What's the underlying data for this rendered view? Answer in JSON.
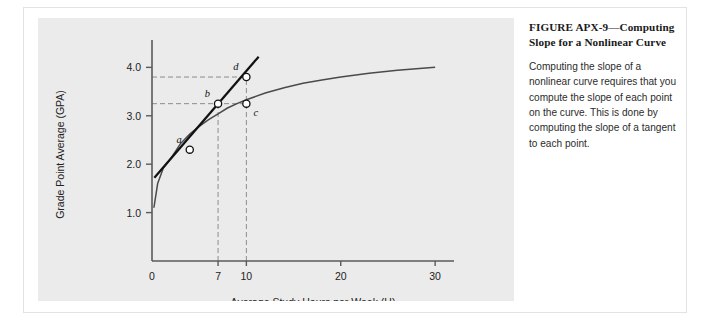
{
  "figure": {
    "caption_title": "FIGURE APX-9—Computing Slope for a Nonlinear Curve",
    "caption_body": "Computing the slope of a nonlinear curve requires that you compute the slope of each point on the curve. This is done by computing the slope of a tangent to each point."
  },
  "colors": {
    "panel_background": "#ebebeb",
    "frame_background": "#ffffff",
    "axis": "#5a5a5a",
    "curve": "#4a4a4a",
    "tangent": "#111111",
    "dashed_guide": "#8c8c8c",
    "point_fill": "#ffffff",
    "point_stroke": "#111111",
    "text": "#222222"
  },
  "chart_data": {
    "type": "line",
    "title": "",
    "xlabel": "Average Study Hours per Week (H)",
    "ylabel": "Grade Point Average (GPA)",
    "xlim": [
      0,
      32
    ],
    "ylim": [
      0,
      4.4
    ],
    "xticks": [
      0,
      7,
      10,
      20,
      30
    ],
    "xtick_labels": [
      "0",
      "7",
      "10",
      "20",
      "30"
    ],
    "yticks": [
      1.0,
      2.0,
      3.0,
      4.0
    ],
    "ytick_labels": [
      "1.0",
      "2.0",
      "3.0",
      "4.0"
    ],
    "grid": false,
    "legend": "none",
    "series": [
      {
        "name": "nonlinear-curve",
        "style": "solid-thin",
        "x": [
          0.2,
          0.6,
          1.2,
          2,
          3,
          4,
          5,
          6,
          7,
          8,
          9,
          10,
          12,
          14,
          16,
          18,
          20,
          23,
          26,
          30
        ],
        "y": [
          1.1,
          1.6,
          1.92,
          2.12,
          2.42,
          2.62,
          2.78,
          2.92,
          3.04,
          3.16,
          3.25,
          3.33,
          3.47,
          3.58,
          3.67,
          3.74,
          3.8,
          3.88,
          3.94,
          4.0
        ]
      },
      {
        "name": "tangent-line-at-a",
        "style": "solid-thick",
        "x": [
          0.25,
          11.3
        ],
        "y": [
          1.72,
          4.22
        ]
      }
    ],
    "points": [
      {
        "label": "a",
        "x": 4,
        "y": 2.3,
        "on": "curve-and-tangent",
        "label_position": "above-left"
      },
      {
        "label": "b",
        "x": 7,
        "y": 3.25,
        "on": "tangent",
        "label_position": "above-left"
      },
      {
        "label": "c",
        "x": 10,
        "y": 3.25,
        "on": "curve",
        "label_position": "below-right"
      },
      {
        "label": "d",
        "x": 10,
        "y": 3.8,
        "on": "tangent",
        "label_position": "above-left"
      }
    ],
    "guides": [
      {
        "type": "horizontal-dashed",
        "y": 3.8,
        "from_x": 0,
        "to_x": 10
      },
      {
        "type": "horizontal-dashed",
        "y": 3.25,
        "from_x": 0,
        "to_x": 10
      },
      {
        "type": "vertical-dashed",
        "x": 7,
        "from_y": 0,
        "to_y": 3.25
      },
      {
        "type": "vertical-dashed",
        "x": 10,
        "from_y": 0,
        "to_y": 3.8
      }
    ]
  }
}
